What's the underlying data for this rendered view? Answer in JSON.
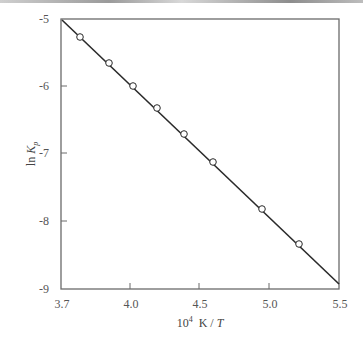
{
  "chart_data": {
    "type": "line",
    "title": "",
    "xlabel": "10^4 K / T",
    "xlabel_parts": {
      "base": "10",
      "exp": "4",
      "rest": " K / ",
      "italic": "T"
    },
    "ylabel": "ln K_p",
    "ylabel_parts": {
      "pre": "ln ",
      "italic": "K",
      "sub": "p"
    },
    "xlim": [
      3.7,
      5.5
    ],
    "ylim": [
      -9,
      -5
    ],
    "x_ticks": [
      {
        "value": 3.7,
        "label": "3.7",
        "px": 61
      },
      {
        "value": 4.0,
        "label": "4.0",
        "px": 130
      },
      {
        "value": 4.5,
        "label": "4.5",
        "px": 199
      },
      {
        "value": 5.0,
        "label": "5.0",
        "px": 269
      },
      {
        "value": 5.5,
        "label": "5.5",
        "px": 339
      }
    ],
    "y_ticks": [
      {
        "value": -5,
        "label": "-5",
        "px": 19
      },
      {
        "value": -6,
        "label": "-6",
        "px": 86
      },
      {
        "value": -7,
        "label": "-7",
        "px": 153
      },
      {
        "value": -8,
        "label": "-8",
        "px": 221
      },
      {
        "value": -9,
        "label": "-9",
        "px": 289
      }
    ],
    "grid": false,
    "legend": null,
    "series": [
      {
        "name": "data points",
        "marker": "open-circle",
        "x": [
          3.78,
          3.91,
          4.02,
          4.2,
          4.39,
          4.6,
          4.95,
          5.21
        ],
        "y": [
          -5.27,
          -5.65,
          -5.99,
          -6.32,
          -6.7,
          -7.12,
          -7.81,
          -8.33
        ],
        "px": [
          [
            80,
            37
          ],
          [
            109,
            63
          ],
          [
            133,
            86
          ],
          [
            157,
            108
          ],
          [
            184,
            134
          ],
          [
            213,
            162
          ],
          [
            262,
            209
          ],
          [
            299,
            244
          ]
        ]
      },
      {
        "name": "linear fit",
        "marker": "none",
        "x": [
          3.7,
          5.5
        ],
        "y": [
          -5.0,
          -8.92
        ],
        "px": [
          [
            62,
            20
          ],
          [
            339,
            284
          ]
        ]
      }
    ]
  },
  "colors": {
    "axis": "#6a6a6a",
    "line": "#2a2a2a",
    "marker_fill": "#ffffff"
  }
}
